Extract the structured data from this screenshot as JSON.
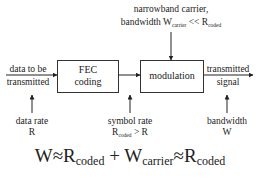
{
  "diagram": {
    "blocks": [
      {
        "id": "fec",
        "line1": "FEC",
        "line2": "coding"
      },
      {
        "id": "modulation",
        "label": "modulation"
      }
    ],
    "input": {
      "line1": "data to be",
      "line2": "transmitted"
    },
    "output": {
      "line1": "transmitted",
      "line2": "signal"
    },
    "carrier": {
      "line1": "narrowband carrier,",
      "line2_prefix": "bandwidth W",
      "line2_sub1": "carrier",
      "line2_mid": " << R",
      "line2_sub2": "coded"
    },
    "annotations": {
      "data_rate": {
        "line1": "data rate",
        "line2": "R"
      },
      "symbol_rate": {
        "line1": "symbol rate",
        "line2_main": "R",
        "line2_sub": "coded",
        "line2_rest": " > R"
      },
      "bandwidth": {
        "line1": "bandwidth",
        "line2": "W"
      }
    },
    "equation": {
      "w": "W",
      "approx1": "≈",
      "r1": "R",
      "r1_sub": "coded",
      "plus": " + ",
      "w2": "W",
      "w2_sub": "carrier",
      "approx2": "≈",
      "r2": "R",
      "r2_sub": "coded"
    },
    "colors": {
      "stroke": "#222222",
      "background": "#ffffff"
    }
  }
}
